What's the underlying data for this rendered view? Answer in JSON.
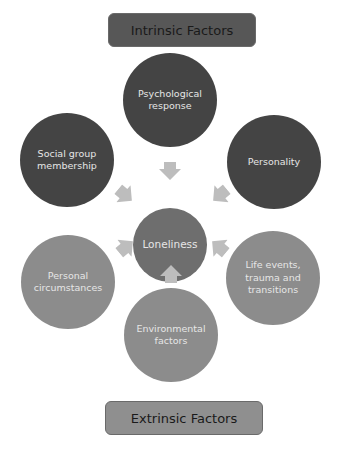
{
  "title_boxes": {
    "top": {
      "label": "Intrinsic Factors",
      "color": "#575757"
    },
    "bottom": {
      "label": "Extrinsic Factors",
      "color": "#8f8f8f"
    }
  },
  "center": {
    "label": "Loneliness",
    "color": "#6e6e6e"
  },
  "factors": [
    {
      "label": "Psychological response",
      "type": "intrinsic",
      "color": "#444444"
    },
    {
      "label": "Social group membership",
      "type": "intrinsic",
      "color": "#444444"
    },
    {
      "label": "Personality",
      "type": "intrinsic",
      "color": "#444444"
    },
    {
      "label": "Personal circumstances",
      "type": "extrinsic",
      "color": "#8c8c8c"
    },
    {
      "label": "Life events, trauma and transitions",
      "type": "extrinsic",
      "color": "#8c8c8c"
    },
    {
      "label": "Environmental factors",
      "type": "extrinsic",
      "color": "#8c8c8c"
    }
  ],
  "arrow_color": "#bdbdbd"
}
